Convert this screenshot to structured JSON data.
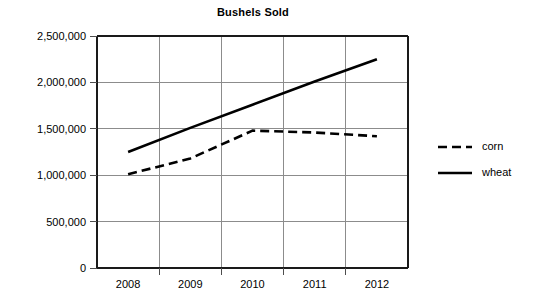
{
  "chart_data": {
    "type": "line",
    "title": "Bushels Sold",
    "xlabel": "",
    "ylabel": "",
    "categories": [
      "2008",
      "2009",
      "2010",
      "2011",
      "2012"
    ],
    "x": [
      2008,
      2009,
      2010,
      2011,
      2012
    ],
    "series": [
      {
        "name": "corn",
        "style": "dashed",
        "color": "#000000",
        "values": [
          1010000,
          1180000,
          1480000,
          1460000,
          1420000
        ]
      },
      {
        "name": "wheat",
        "style": "solid",
        "color": "#000000",
        "values": [
          1250000,
          1510000,
          1760000,
          2010000,
          2250000
        ]
      }
    ],
    "ylim": [
      0,
      2500000
    ],
    "yticks": [
      0,
      500000,
      1000000,
      1500000,
      2000000,
      2500000
    ],
    "ytick_labels": [
      "0",
      "500,000",
      "1,000,000",
      "1,500,000",
      "2,000,000",
      "2,500,000"
    ],
    "grid": true,
    "legend_position": "right"
  },
  "legend": {
    "entries": [
      {
        "label": "corn",
        "style": "dashed"
      },
      {
        "label": "wheat",
        "style": "solid"
      }
    ]
  }
}
